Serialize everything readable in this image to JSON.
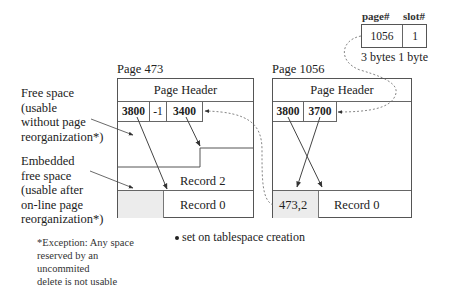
{
  "pointer": {
    "headers": {
      "page": "page#",
      "slot": "slot#"
    },
    "values": {
      "page": "1056",
      "slot": "1"
    },
    "sizes": "3 bytes 1 byte"
  },
  "page473": {
    "title": "Page  473",
    "header": "Page Header",
    "slots": [
      "3800",
      "-1",
      "3400"
    ],
    "records": [
      "Record  2",
      "Record  0"
    ]
  },
  "page1056": {
    "title": "Page  1056",
    "header": "Page Header",
    "slots": [
      "3800",
      "3700"
    ],
    "forward_record": "473,2",
    "records": [
      "Record  0"
    ]
  },
  "annotations": {
    "free_space": [
      "Free space",
      "(usable",
      "without page",
      "reorganization*)"
    ],
    "embedded_free_space": [
      "Embedded",
      "free space",
      "(usable after",
      "on-line page",
      "reorganization*)"
    ],
    "exception": [
      "*Exception: Any space",
      "reserved by an",
      "uncommited",
      "delete is not usable"
    ],
    "bullet_note": "set on tablespace creation"
  }
}
